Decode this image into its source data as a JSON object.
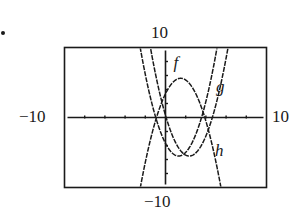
{
  "chart_data": {
    "type": "line",
    "title": "",
    "xlabel": "",
    "ylabel": "",
    "xlim": [
      -10,
      10
    ],
    "ylim": [
      -10,
      10
    ],
    "grid": false,
    "window_labels": {
      "top": "10",
      "bottom": "-10",
      "left": "-10",
      "right": "10"
    },
    "x_tick_step": 2,
    "y_tick_step": 2,
    "series": [
      {
        "name": "f",
        "kind": "parabola",
        "a": -0.98,
        "h": 1.5,
        "k": 5.6,
        "label_pos": [
          1.2,
          7.8
        ]
      },
      {
        "name": "g",
        "kind": "parabola",
        "a": 1.05,
        "h": 2.35,
        "k": -5.5,
        "label_pos": [
          5.4,
          4.4
        ]
      },
      {
        "name": "h",
        "kind": "parabola",
        "a": 1.07,
        "h": 1.3,
        "k": -5.5,
        "label_pos": [
          5.3,
          -4.8
        ]
      }
    ]
  },
  "labels": {
    "top": "10",
    "bottom": "−10",
    "left": "−10",
    "right": "10",
    "f": "f",
    "g": "g",
    "h": "h"
  }
}
